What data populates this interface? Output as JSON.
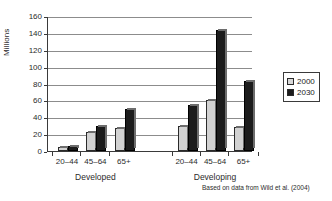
{
  "chart_data": {
    "type": "bar",
    "title": "",
    "subtitle": "",
    "xlabel": "",
    "ylabel": "Millions",
    "ylim": [
      0,
      160
    ],
    "ytick_step": 20,
    "yticks": [
      0,
      20,
      40,
      60,
      80,
      100,
      120,
      140,
      160
    ],
    "grid": true,
    "legend_position": "right",
    "groups": [
      "Developed",
      "Developing"
    ],
    "categories": [
      "20–44",
      "45–64",
      "65+",
      "20–44",
      "45–64",
      "65+"
    ],
    "series": [
      {
        "name": "2000",
        "color": "#d2d2d2",
        "values": [
          5,
          23,
          27,
          30,
          60,
          28
        ]
      },
      {
        "name": "2030",
        "color": "#1c1c1c",
        "values": [
          6,
          30,
          50,
          55,
          143,
          83
        ]
      }
    ],
    "annotations": [
      "Based on data from Wild et al. (2004)"
    ]
  },
  "axis": {
    "y_title": "Millions",
    "y_tick_labels": [
      "160",
      "140",
      "120",
      "100",
      "80",
      "60",
      "40",
      "20",
      "0"
    ]
  },
  "x_axis": {
    "categories": [
      "20–44",
      "45–64",
      "65+",
      "20–44",
      "45–64",
      "65+"
    ],
    "group_labels": [
      "Developed",
      "Developing"
    ]
  },
  "legend": {
    "entries": [
      {
        "label": "2000",
        "color": "#d2d2d2"
      },
      {
        "label": "2030",
        "color": "#1c1c1c"
      }
    ]
  },
  "footer": {
    "source": "Based on data from Wild et al. (2004)"
  }
}
